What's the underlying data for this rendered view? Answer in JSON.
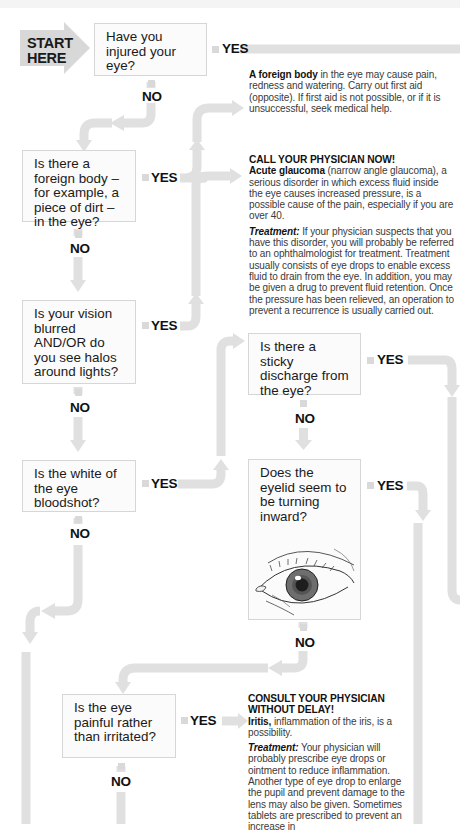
{
  "start": {
    "line1": "START",
    "line2": "HERE"
  },
  "questions": [
    {
      "id": "q1",
      "text": "Have you injured your eye?"
    },
    {
      "id": "q2",
      "text": "Is there a foreign body – for example, a piece of dirt – in the eye?"
    },
    {
      "id": "q3",
      "text": "Is your vision blurred AND/OR do you see halos around lights?"
    },
    {
      "id": "q4",
      "text": "Is the white of the eye bloodshot?"
    },
    {
      "id": "q5",
      "text": "Is there a sticky discharge from the eye?"
    },
    {
      "id": "q6",
      "text": "Does the eyelid seem to be turning inward?"
    },
    {
      "id": "q7",
      "text": "Is the eye painful rather than irritated?"
    }
  ],
  "labels": {
    "yes": "YES",
    "no": "NO"
  },
  "outcomes": {
    "foreign_body": {
      "term": "A foreign body",
      "text": " in the eye may cause pain, redness and watering. Carry out first aid (opposite). If first aid is not possible, or if it is unsuccessful, seek medical help."
    },
    "glaucoma": {
      "heading": "CALL YOUR PHYSICIAN NOW!",
      "term": "Acute glaucoma",
      "text": " (narrow angle glaucoma), a serious disorder in which excess fluid inside the eye causes increased pressure, is a possible cause of the pain, especially if you are over 40.",
      "treatment_label": "Treatment:",
      "treatment_text": " If your physician suspects that you have this disorder, you will probably be referred to an ophthalmologist for treatment. Treatment usually consists of eye drops to enable excess fluid to drain from the eye. In addition, you may be given a drug to prevent fluid retention. Once the pressure has been relieved, an operation to prevent a recurrence is usually carried out."
    },
    "iritis": {
      "heading": "CONSULT YOUR PHYSICIAN WITHOUT DELAY!",
      "term": "Iritis,",
      "text": " inflammation of the iris, is a possibility.",
      "treatment_label": "Treatment:",
      "treatment_text": " Your physician will probably prescribe eye drops or ointment to reduce inflammation. Another type of eye drop to enlarge the pupil and prevent damage to the lens may also be given. Sometimes tablets are prescribed to prevent an increase in"
    }
  },
  "colors": {
    "connector": "#e0e0e0",
    "box_border": "#d6d6d6",
    "start_arrow": "#d8d8d8"
  }
}
